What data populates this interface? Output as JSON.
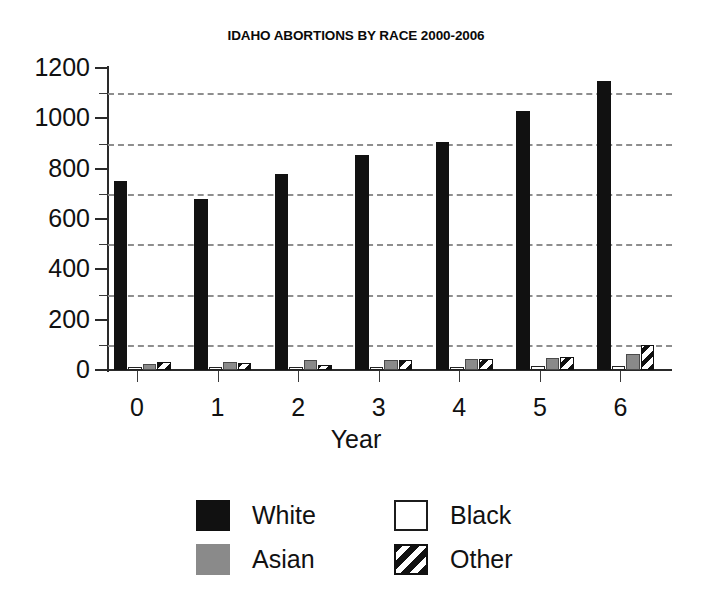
{
  "chart_data": {
    "type": "bar",
    "title": "IDAHO ABORTIONS BY RACE 2000-2006",
    "xlabel": "Year",
    "ylabel": "",
    "categories": [
      "0",
      "1",
      "2",
      "3",
      "4",
      "5",
      "6"
    ],
    "series": [
      {
        "name": "White",
        "style": "solid-black",
        "color": "#111111",
        "values": [
          750,
          680,
          778,
          855,
          905,
          1030,
          1148
        ]
      },
      {
        "name": "Black",
        "style": "open-white",
        "color": "#ffffff",
        "values": [
          12,
          10,
          10,
          12,
          10,
          15,
          14
        ]
      },
      {
        "name": "Asian",
        "style": "solid-gray",
        "color": "#8a8a8a",
        "values": [
          25,
          30,
          38,
          40,
          42,
          48,
          62
        ]
      },
      {
        "name": "Other",
        "style": "diagonal-hatch",
        "color": "#111111",
        "values": [
          30,
          28,
          18,
          38,
          44,
          52,
          100
        ]
      }
    ],
    "ylim": [
      0,
      1200
    ],
    "y_ticks": [
      0,
      200,
      400,
      600,
      800,
      1000,
      1200
    ],
    "y_tick_labels": [
      "0",
      "200",
      "400",
      "600",
      "800",
      "1000",
      "1200"
    ],
    "y_minor_ticks": [
      100,
      300,
      500,
      700,
      900,
      1100
    ],
    "gridlines": [
      100,
      300,
      500,
      700,
      900,
      1100
    ],
    "grid": true,
    "grid_style": "dashed",
    "legend_position": "bottom",
    "legend_entries": [
      "White",
      "Black",
      "Asian",
      "Other"
    ]
  }
}
